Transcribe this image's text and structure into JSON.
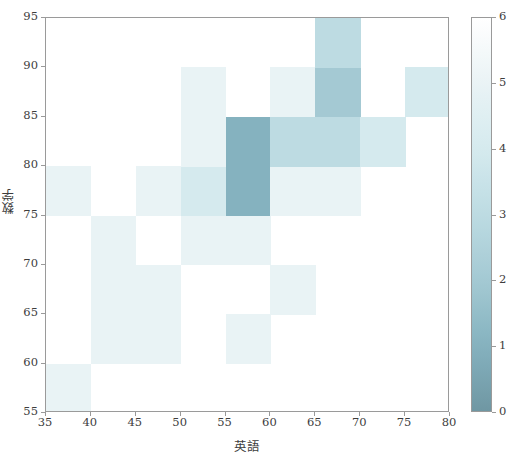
{
  "chart_data": {
    "type": "heatmap",
    "title": "",
    "xlabel": "英語",
    "ylabel": "数学",
    "xlim": [
      35,
      80
    ],
    "ylim": [
      55,
      95
    ],
    "xtick_labels": [
      "35",
      "40",
      "45",
      "50",
      "55",
      "60",
      "65",
      "70",
      "75",
      "80"
    ],
    "ytick_labels": [
      "55",
      "60",
      "65",
      "70",
      "75",
      "80",
      "85",
      "90",
      "95"
    ],
    "xticks": [
      35,
      40,
      45,
      50,
      55,
      60,
      65,
      70,
      75,
      80
    ],
    "yticks": [
      55,
      60,
      65,
      70,
      75,
      80,
      85,
      90,
      95
    ],
    "x_bin_edges": [
      35,
      40,
      45,
      50,
      55,
      60,
      65,
      70,
      75,
      80
    ],
    "y_bin_edges": [
      55,
      60,
      65,
      70,
      75,
      80,
      85,
      90,
      95
    ],
    "grid": false,
    "colorbar": {
      "position": "right",
      "vmin": 0,
      "vmax": 6,
      "tick_labels": [
        "0",
        "1",
        "2",
        "3",
        "4",
        "5",
        "6"
      ],
      "ticks": [
        0,
        1,
        2,
        3,
        4,
        5,
        6
      ],
      "colormap_low": "#ffffff",
      "colormap_high": "#6f97a3"
    },
    "counts_note": "rows ordered bottom(55-60) to top(90-95); columns left(35-40) to right(75-80)",
    "counts": [
      [
        1,
        0,
        0,
        0,
        0,
        0,
        0,
        0,
        0
      ],
      [
        0,
        1,
        1,
        0,
        1,
        0,
        0,
        0,
        0
      ],
      [
        0,
        1,
        1,
        0,
        0,
        1,
        0,
        0,
        0
      ],
      [
        0,
        1,
        0,
        1,
        1,
        0,
        0,
        0,
        0
      ],
      [
        1,
        0,
        1,
        2,
        5,
        1,
        1,
        0,
        0
      ],
      [
        0,
        0,
        0,
        1,
        5,
        3,
        3,
        2,
        0
      ],
      [
        0,
        0,
        0,
        1,
        0,
        1,
        4,
        0,
        2
      ],
      [
        0,
        0,
        0,
        0,
        0,
        0,
        3,
        0,
        0
      ]
    ]
  },
  "axes": {
    "y_axis_name": "数学",
    "x_axis_name": "英語"
  },
  "colorbar_meta": {
    "label": ""
  }
}
